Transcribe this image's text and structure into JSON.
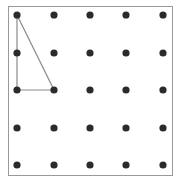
{
  "diagram": {
    "type": "geoboard",
    "grid_rows": 5,
    "grid_cols": 5,
    "frame": {
      "x": 8.5,
      "y": 6.5,
      "width": 164,
      "height": 169,
      "stroke": "#999999"
    },
    "dot_color": "#2b2b2b",
    "dot_radius": 3.6,
    "col_x": [
      17,
      54,
      90,
      126,
      163
    ],
    "row_y": [
      15,
      53,
      90,
      128,
      165
    ],
    "shape": {
      "kind": "right-triangle",
      "stroke": "#8a8a8a",
      "vertices_grid": [
        [
          0,
          0
        ],
        [
          0,
          2
        ],
        [
          1,
          2
        ]
      ]
    }
  }
}
